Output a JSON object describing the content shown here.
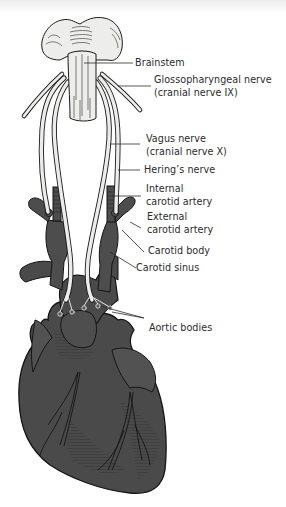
{
  "figure": {
    "colors": {
      "background": "#ffffff",
      "heart_fill": "#4a4a4a",
      "vessel_fill": "#4d4d4d",
      "nerve_fill": "#ececea",
      "outline": "#1a1a1a",
      "label_text": "#2b2b2b"
    },
    "labels": {
      "brainstem": "Brainstem",
      "glossopharyngeal_line1": "Glossopharyngeal nerve",
      "glossopharyngeal_line2": "(cranial nerve IX)",
      "vagus_line1": "Vagus nerve",
      "vagus_line2": "(cranial nerve X)",
      "herings": "Hering’s nerve",
      "internal_carotid_line1": "Internal",
      "internal_carotid_line2": "carotid artery",
      "external_carotid_line1": "External",
      "external_carotid_line2": "carotid artery",
      "carotid_body": "Carotid body",
      "carotid_sinus": "Carotid sinus",
      "aortic_bodies": "Aortic bodies"
    },
    "structures": [
      "brainstem",
      "glossopharyngeal-nerve",
      "vagus-nerve",
      "herings-nerve",
      "internal-carotid-artery",
      "external-carotid-artery",
      "carotid-body",
      "carotid-sinus",
      "aortic-arch",
      "aortic-bodies",
      "heart"
    ]
  }
}
